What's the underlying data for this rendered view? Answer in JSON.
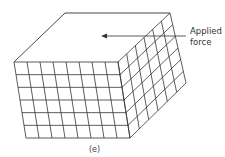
{
  "diagram": {
    "type": "sheared-block",
    "caption": "(e)",
    "annotation": {
      "line1": "Applied",
      "line2": "force"
    },
    "grid": {
      "front_columns": 8,
      "front_rows": 6,
      "side_columns": 6,
      "side_rows": 6
    },
    "colors": {
      "stroke": "#333333",
      "background": "#ffffff"
    }
  }
}
